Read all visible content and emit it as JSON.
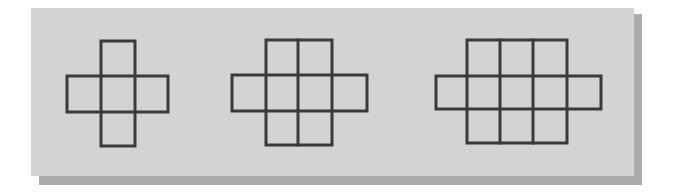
{
  "diagram": {
    "title": "",
    "colors": {
      "background": "#ffffff",
      "panel": "#d3d3d3",
      "shadow": "#ababab",
      "stroke": "#3a3a3a"
    },
    "figures": [
      {
        "name": "figure-1",
        "description": "plus-shaped net: 1-wide column of 3 squares crossed by a row of 3 squares",
        "column_x": [
          101,
          135
        ],
        "column_y": [
          41,
          146
        ],
        "row_x": [
          67,
          168
        ],
        "row_y": [
          76,
          112
        ],
        "cell_count": 5
      },
      {
        "name": "figure-2",
        "description": "2-wide column of 3 squares crossed by a row of 4 squares",
        "column_x": [
          266,
          298,
          332
        ],
        "column_y": [
          40,
          145
        ],
        "row_x": [
          232,
          367
        ],
        "row_y": [
          75,
          111
        ],
        "cell_count": 8
      },
      {
        "name": "figure-3",
        "description": "3-wide column of 3 squares crossed by a row of 5 squares",
        "column_x": [
          467,
          500,
          533,
          567
        ],
        "column_y": [
          40,
          143
        ],
        "row_x": [
          436,
          601
        ],
        "row_y": [
          76,
          109
        ],
        "cell_count": 11
      }
    ]
  }
}
